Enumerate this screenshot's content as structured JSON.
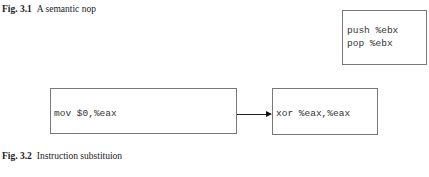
{
  "figures": [
    {
      "label": "Fig. 3.1",
      "caption": "A semantic nop",
      "code_lines": [
        "push %ebx",
        "pop %ebx"
      ]
    },
    {
      "label": "Fig. 3.2",
      "caption": "Instruction substituion",
      "source_code": "mov $0,%eax",
      "target_code": "xor %eax,%eax"
    }
  ]
}
